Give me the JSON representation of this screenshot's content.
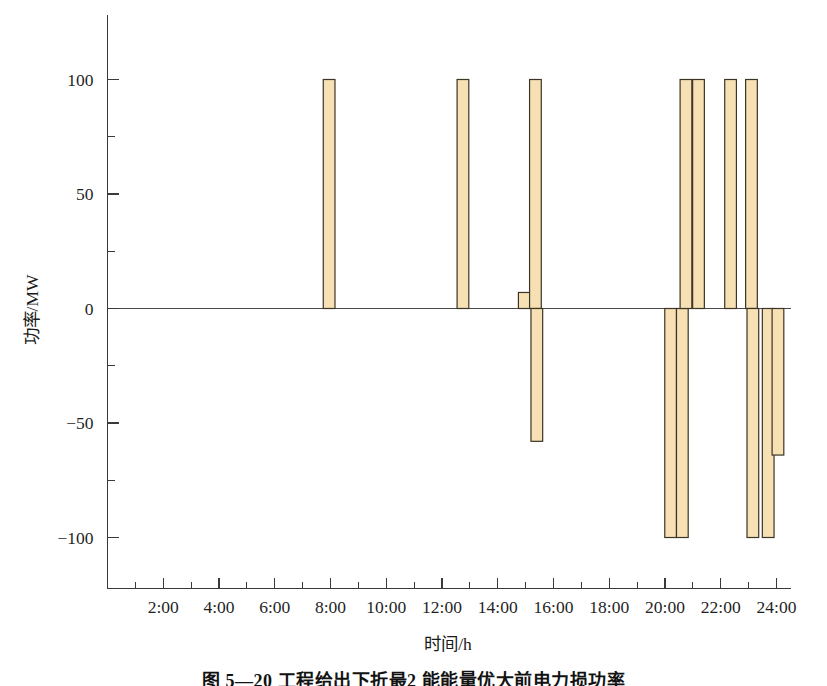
{
  "figure": {
    "caption": "图 5—20 工程给出下折最2 能能量优大前电力损功率",
    "caption_visible_fragment": "图 5—20"
  },
  "chart_data": {
    "type": "bar",
    "title": "",
    "xlabel": "时间/h",
    "ylabel": "功率/MW",
    "xlim": [
      0,
      24.5
    ],
    "ylim": [
      -125,
      125
    ],
    "grid": false,
    "legend": "none",
    "bar_fill_color": "#f6e0b4",
    "bar_edge_color": "#3c3425",
    "x_ticks_major": [
      2,
      4,
      6,
      8,
      10,
      12,
      14,
      16,
      18,
      20,
      22,
      24
    ],
    "x_tick_labels": [
      "2:00",
      "4:00",
      "6:00",
      "8:00",
      "10:00",
      "12:00",
      "14:00",
      "16:00",
      "18:00",
      "20:00",
      "22:00",
      "24:00"
    ],
    "x_ticks_minor": [
      1,
      3,
      5,
      7,
      9,
      11,
      13,
      15,
      17,
      19,
      21,
      23
    ],
    "y_ticks_major": [
      -100,
      -50,
      0,
      50,
      100
    ],
    "y_tick_labels": [
      "-100",
      "-50",
      "0",
      "50",
      "100"
    ],
    "y_ticks_minor": [
      -75,
      -25,
      25,
      75
    ],
    "bar_width_hours": 0.42,
    "bars": [
      {
        "x": 7.95,
        "value": 100
      },
      {
        "x": 12.75,
        "value": 100
      },
      {
        "x": 14.95,
        "value": 7
      },
      {
        "x": 15.35,
        "value": 100
      },
      {
        "x": 15.4,
        "value": -58
      },
      {
        "x": 20.2,
        "value": -100
      },
      {
        "x": 20.62,
        "value": -100
      },
      {
        "x": 20.75,
        "value": 100
      },
      {
        "x": 21.2,
        "value": 100
      },
      {
        "x": 22.35,
        "value": 100
      },
      {
        "x": 23.1,
        "value": 100
      },
      {
        "x": 23.15,
        "value": -100
      },
      {
        "x": 23.7,
        "value": -100
      },
      {
        "x": 24.05,
        "value": -64
      }
    ]
  }
}
